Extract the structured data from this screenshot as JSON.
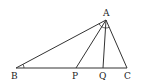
{
  "diagram": {
    "type": "triangle-geometry",
    "points": {
      "A": {
        "label": "A",
        "x": 106,
        "y": 20
      },
      "B": {
        "label": "B",
        "x": 16,
        "y": 68
      },
      "P": {
        "label": "P",
        "x": 76,
        "y": 68
      },
      "Q": {
        "label": "Q",
        "x": 103,
        "y": 68
      },
      "C": {
        "label": "C",
        "x": 127,
        "y": 68
      }
    },
    "segments": [
      "AB",
      "AP",
      "AQ",
      "AC",
      "BC"
    ],
    "angle_marks": [
      "angle-B",
      "angle-BAP",
      "angle-PAQ",
      "angle-QAC"
    ],
    "colors": {
      "stroke": "#333333",
      "background": "#ffffff"
    }
  }
}
